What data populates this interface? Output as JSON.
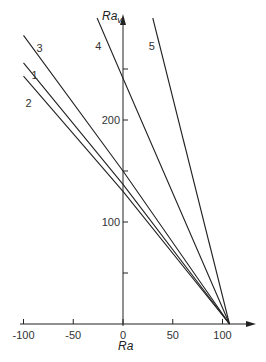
{
  "chart_data": {
    "type": "line",
    "title": "",
    "xlabel": "Ra",
    "ylabel": "Ra_v",
    "xlim": [
      -100,
      125
    ],
    "ylim": [
      0,
      300
    ],
    "grid": false,
    "legend": "inline labels near line starts",
    "x_ticks": [
      -100,
      -50,
      0,
      50,
      100
    ],
    "x_tick_labels": [
      "-100",
      "-50",
      "0",
      "50",
      "100"
    ],
    "y_ticks": [
      50,
      100,
      150,
      200,
      250
    ],
    "y_tick_labels": [
      "",
      "100",
      "",
      "200",
      ""
    ],
    "convergence_point": {
      "Ra": 107,
      "Rav": 0
    },
    "series": [
      {
        "name": "1",
        "points": [
          {
            "x": -100,
            "y": 256
          },
          {
            "x": 0,
            "y": 137
          },
          {
            "x": 107,
            "y": 0
          }
        ],
        "label_pos": {
          "x": -92,
          "y": 240
        }
      },
      {
        "name": "2",
        "points": [
          {
            "x": -100,
            "y": 243
          },
          {
            "x": 0,
            "y": 130
          },
          {
            "x": 107,
            "y": 0
          }
        ],
        "label_pos": {
          "x": -98,
          "y": 213
        }
      },
      {
        "name": "3",
        "points": [
          {
            "x": -100,
            "y": 283
          },
          {
            "x": 0,
            "y": 150
          },
          {
            "x": 107,
            "y": 0
          }
        ],
        "label_pos": {
          "x": -87,
          "y": 267
        }
      },
      {
        "name": "4",
        "points": [
          {
            "x": -26,
            "y": 300
          },
          {
            "x": 0,
            "y": 241
          },
          {
            "x": 107,
            "y": 0
          }
        ],
        "label_pos": {
          "x": -28,
          "y": 269
        }
      },
      {
        "name": "5",
        "points": [
          {
            "x": 30,
            "y": 300
          },
          {
            "x": 107,
            "y": 0
          }
        ],
        "label_pos": {
          "x": 26,
          "y": 269
        }
      }
    ]
  },
  "labels": {
    "x_axis": "Ra",
    "y_axis_main": "Ra",
    "y_axis_sub": "v"
  }
}
